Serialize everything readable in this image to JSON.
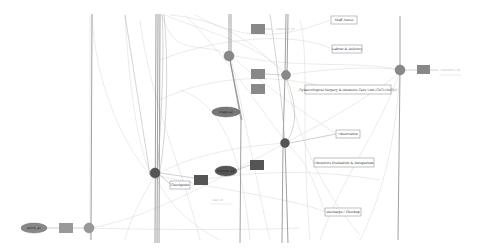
{
  "diagram": {
    "type": "network-graph",
    "background": "#ffffff",
    "colors": {
      "place_fill": "#888888",
      "place_dark_fill": "#555555",
      "transition_fill": "#888888",
      "transition_dark_fill": "#555555",
      "ellipse_fill": "#777777",
      "label_box_border": "#666666",
      "edge_light": "#d0d0d0",
      "edge_dark": "#707070"
    },
    "label_boxes": [
      {
        "id": "lb1",
        "text": "Staff Nurse",
        "x": 331,
        "y": 16,
        "w": 26,
        "h": 8
      },
      {
        "id": "lb2",
        "text": "Labour & Delivery",
        "x": 332,
        "y": 45,
        "w": 30,
        "h": 8
      },
      {
        "id": "lb3",
        "text": "Gynaecological Surgery & Intensive Care Unit (GICU/NICU)",
        "x": 305,
        "y": 85,
        "w": 86,
        "h": 9
      },
      {
        "id": "lb4",
        "text": "Observation",
        "x": 336,
        "y": 130,
        "w": 24,
        "h": 8
      },
      {
        "id": "lb5",
        "text": "Obstetrics Evaluation & Antepartum",
        "x": 314,
        "y": 158,
        "w": 60,
        "h": 9
      },
      {
        "id": "lb6",
        "text": "Discharge / Checkup",
        "x": 325,
        "y": 208,
        "w": 36,
        "h": 8
      },
      {
        "id": "lb7",
        "text": "Checkpoint",
        "x": 170,
        "y": 181,
        "w": 20,
        "h": 8
      }
    ],
    "ellipses": [
      {
        "id": "e1",
        "text": "admit_a1",
        "cx": 34,
        "cy": 228,
        "rx": 13,
        "ry": 5
      },
      {
        "id": "e2",
        "text": "triage_a2",
        "cx": 226,
        "cy": 112,
        "rx": 14,
        "ry": 5
      },
      {
        "id": "e3",
        "text": "transfer_a3",
        "cx": 226,
        "cy": 171,
        "rx": 11,
        "ry": 5
      }
    ],
    "faint_labels": [
      {
        "id": "fl1",
        "text": "transition_t1",
        "x": 276,
        "y": 29
      },
      {
        "id": "fl2",
        "text": "transition_t9",
        "x": 441,
        "y": 71
      },
      {
        "id": "fl3",
        "text": "bed_t4",
        "x": 213,
        "y": 200
      }
    ]
  }
}
